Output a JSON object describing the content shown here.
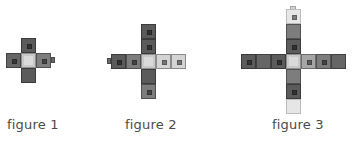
{
  "figures": [
    {
      "label": "figure 1",
      "squares": 5,
      "arm_length": 1
    },
    {
      "label": "figure 2",
      "squares": 9,
      "arm_length": 2
    },
    {
      "label": "figure 3",
      "squares": 13,
      "arm_length": 3
    }
  ],
  "colors": {
    "dark": "#5b5b5b",
    "medium": "#7d7d7d",
    "medium_light": "#a6a6a6",
    "light": "#d4d4d4",
    "center": "#dadada",
    "caption_text": "#4a4a4a",
    "background": "#ffffff"
  }
}
